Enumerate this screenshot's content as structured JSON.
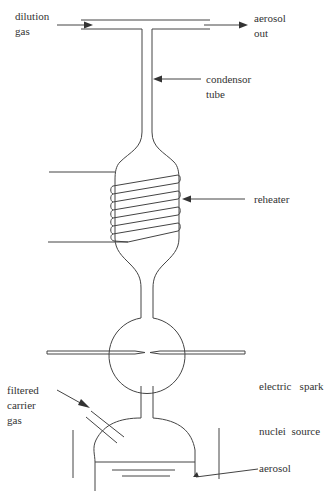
{
  "figure": {
    "labels": {
      "dilution_gas": [
        "dilution",
        "gas"
      ],
      "aerosol_out": [
        "aerosol",
        "out"
      ],
      "condensor_tube": [
        "condensor",
        "tube"
      ],
      "reheater": [
        "reheater"
      ],
      "spark_source": [
        "electric   spark",
        "nuclei  source"
      ],
      "carrier_gas": [
        "filtered",
        "carrier",
        "gas"
      ],
      "aerosol": [
        "aerosol"
      ]
    },
    "colors": {
      "line": "#444444",
      "text": "#333333",
      "background": "#ffffff"
    }
  }
}
